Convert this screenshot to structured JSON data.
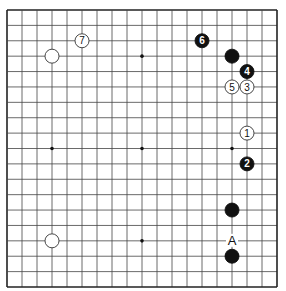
{
  "diagram": {
    "type": "go-board",
    "size": 19,
    "colors": {
      "background": "#ffffff",
      "line": "#444444",
      "border": "#222222",
      "black_stone": "#111111",
      "white_stone": "#ffffff",
      "white_stone_edge": "#333333"
    },
    "hoshi": [
      [
        3,
        3
      ],
      [
        9,
        3
      ],
      [
        15,
        3
      ],
      [
        3,
        9
      ],
      [
        9,
        9
      ],
      [
        15,
        9
      ],
      [
        3,
        15
      ],
      [
        9,
        15
      ],
      [
        15,
        15
      ]
    ],
    "stones": [
      {
        "color": "white",
        "col": 3,
        "row": 3,
        "label": ""
      },
      {
        "color": "white",
        "col": 5,
        "row": 2,
        "label": "7"
      },
      {
        "color": "black",
        "col": 13,
        "row": 2,
        "label": "6"
      },
      {
        "color": "black",
        "col": 15,
        "row": 3,
        "label": ""
      },
      {
        "color": "black",
        "col": 16,
        "row": 4,
        "label": "4"
      },
      {
        "color": "white",
        "col": 15,
        "row": 5,
        "label": "5"
      },
      {
        "color": "white",
        "col": 16,
        "row": 5,
        "label": "3"
      },
      {
        "color": "white",
        "col": 16,
        "row": 8,
        "label": "1"
      },
      {
        "color": "black",
        "col": 16,
        "row": 10,
        "label": "2"
      },
      {
        "color": "black",
        "col": 15,
        "row": 13,
        "label": ""
      },
      {
        "color": "black",
        "col": 15,
        "row": 16,
        "label": ""
      },
      {
        "color": "white",
        "col": 3,
        "row": 15,
        "label": ""
      }
    ],
    "markers": [
      {
        "col": 15,
        "row": 15,
        "label": "A"
      }
    ]
  }
}
